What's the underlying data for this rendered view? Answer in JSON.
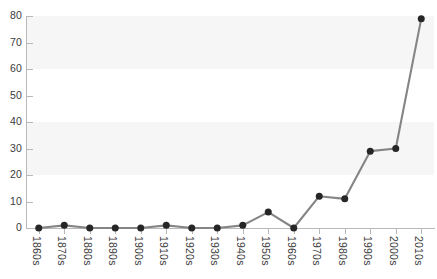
{
  "chart_data": {
    "type": "line",
    "title": "",
    "subtitle": "",
    "xlabel": "",
    "ylabel": "",
    "categories": [
      "1860s",
      "1870s",
      "1880s",
      "1890s",
      "1900s",
      "1910s",
      "1920s",
      "1930s",
      "1940s",
      "1950s",
      "1960s",
      "1970s",
      "1980s",
      "1990s",
      "2000s",
      "2010s"
    ],
    "values": [
      0,
      1,
      0,
      0,
      0,
      1,
      0,
      0,
      1,
      6,
      0,
      12,
      11,
      29,
      30,
      79
    ],
    "series": [
      {
        "name": "Count by decade",
        "values": [
          0,
          1,
          0,
          0,
          0,
          1,
          0,
          0,
          1,
          6,
          0,
          12,
          11,
          29,
          30,
          79
        ]
      }
    ],
    "ylim": [
      0,
      80
    ],
    "xlim_categories": 16,
    "y_ticks": [
      0,
      10,
      20,
      30,
      40,
      50,
      60,
      70,
      80
    ],
    "y_tick_labels": [
      "0",
      "10",
      "20",
      "30",
      "40",
      "50",
      "60",
      "70",
      "80"
    ],
    "grid": false,
    "banded_background": true,
    "band_interval": 20,
    "legend": "none",
    "legend_position": "none",
    "annotations": [],
    "marker": "circle",
    "colors": {
      "line": "#858585",
      "marker": "#262626",
      "band": "#f6f6f6",
      "axis": "#b9b9b9",
      "tick_label": "#3b3b3b",
      "background": "#ffffff"
    }
  }
}
